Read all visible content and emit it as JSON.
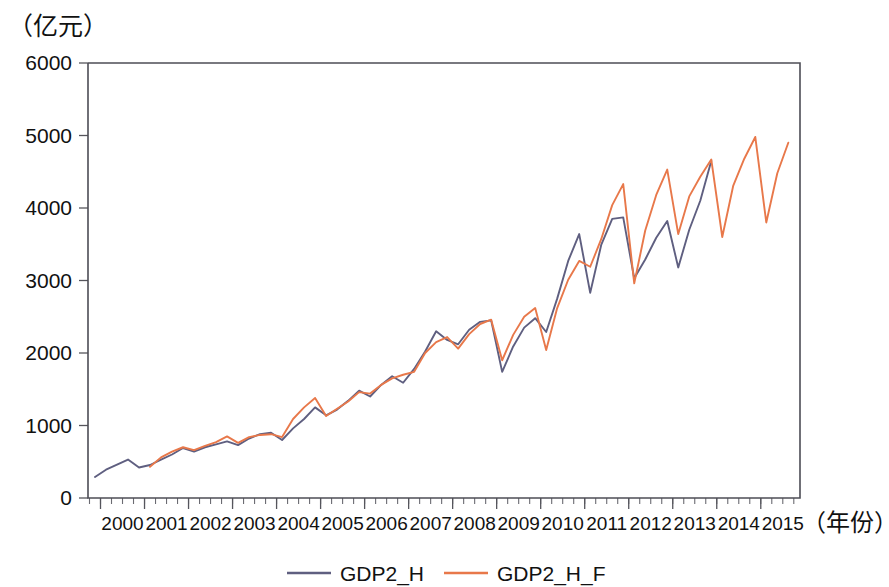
{
  "chart_data": {
    "type": "line",
    "title": "",
    "subtitle": "",
    "ylabel": "（亿元）",
    "xlabel": "（年份）",
    "ylim": [
      0,
      6000
    ],
    "ytick_values": [
      0,
      1000,
      2000,
      3000,
      4000,
      5000,
      6000
    ],
    "ytick_labels": [
      "0",
      "1000",
      "2000",
      "3000",
      "4000",
      "5000",
      "6000"
    ],
    "xtick_labels": [
      "2000",
      "2001",
      "2002",
      "2003",
      "2004",
      "2005",
      "2006",
      "2007",
      "2008",
      "2009",
      "2010",
      "2011",
      "2012",
      "2013",
      "2014",
      "2015"
    ],
    "x_minor_ticks_per_year": 4,
    "x_start_quarter": "1999Q3",
    "x_end_quarter": "2015Q3",
    "grid": false,
    "legend_position": "bottom",
    "legend": [
      "GDP2_H",
      "GDP2_H_F"
    ],
    "colors": {
      "GDP2_H": "#5f5f80",
      "GDP2_H_F": "#e8784a",
      "axis": "#4d4d55",
      "text": "#111111"
    },
    "x": [
      "1999Q4",
      "2000Q1",
      "2000Q2",
      "2000Q3",
      "2000Q4",
      "2001Q1",
      "2001Q2",
      "2001Q3",
      "2001Q4",
      "2002Q1",
      "2002Q2",
      "2002Q3",
      "2002Q4",
      "2003Q1",
      "2003Q2",
      "2003Q3",
      "2003Q4",
      "2004Q1",
      "2004Q2",
      "2004Q3",
      "2004Q4",
      "2005Q1",
      "2005Q2",
      "2005Q3",
      "2005Q4",
      "2006Q1",
      "2006Q2",
      "2006Q3",
      "2006Q4",
      "2007Q1",
      "2007Q2",
      "2007Q3",
      "2007Q4",
      "2008Q1",
      "2008Q2",
      "2008Q3",
      "2008Q4",
      "2009Q1",
      "2009Q2",
      "2009Q3",
      "2009Q4",
      "2010Q1",
      "2010Q2",
      "2010Q3",
      "2010Q4",
      "2011Q1",
      "2011Q2",
      "2011Q3",
      "2011Q4",
      "2012Q1",
      "2012Q2",
      "2012Q3",
      "2012Q4",
      "2013Q1",
      "2013Q2",
      "2013Q3",
      "2013Q4",
      "2014Q1",
      "2014Q2",
      "2014Q3",
      "2014Q4",
      "2015Q1",
      "2015Q2",
      "2015Q3"
    ],
    "series": [
      {
        "name": "GDP2_H",
        "color": "#5f5f80",
        "values": [
          290,
          390,
          460,
          530,
          420,
          455,
          530,
          600,
          690,
          640,
          700,
          740,
          780,
          730,
          820,
          880,
          900,
          800,
          960,
          1090,
          1250,
          1140,
          1220,
          1340,
          1480,
          1400,
          1560,
          1680,
          1590,
          1780,
          2020,
          2300,
          2180,
          2120,
          2320,
          2430,
          2450,
          1740,
          2090,
          2350,
          2480,
          2290,
          2750,
          3270,
          3640,
          2830,
          3490,
          3850,
          3870,
          3030,
          3290,
          3590,
          3820,
          3180,
          3700,
          4100,
          4650,
          null,
          null,
          null,
          null,
          null,
          null,
          null
        ]
      },
      {
        "name": "GDP2_H_F",
        "color": "#e8784a",
        "values": [
          null,
          null,
          null,
          null,
          null,
          430,
          560,
          640,
          700,
          660,
          720,
          770,
          850,
          760,
          840,
          870,
          880,
          840,
          1090,
          1250,
          1380,
          1130,
          1230,
          1330,
          1460,
          1440,
          1560,
          1650,
          1700,
          1740,
          2000,
          2150,
          2220,
          2060,
          2260,
          2400,
          2460,
          1900,
          2250,
          2500,
          2620,
          2040,
          2620,
          3010,
          3270,
          3190,
          3570,
          4040,
          4330,
          2960,
          3690,
          4180,
          4530,
          3640,
          4160,
          4430,
          4670,
          3600,
          4310,
          4680,
          4980,
          3800,
          4480,
          4900
        ]
      }
    ]
  }
}
